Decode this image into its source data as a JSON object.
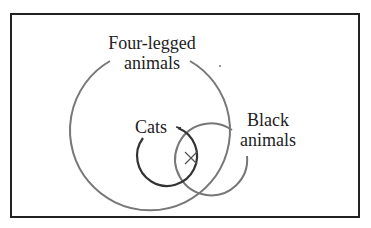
{
  "diagram": {
    "type": "venn",
    "sets": [
      {
        "id": "four-legged",
        "label_line1": "Four-legged",
        "label_line2": "animals",
        "color": "#777777"
      },
      {
        "id": "cats",
        "label": "Cats",
        "color": "#333333"
      },
      {
        "id": "black",
        "label_line1": "Black",
        "label_line2": "animals",
        "color": "#777777"
      }
    ],
    "marker": {
      "symbol": "×",
      "region": "cats ∩ black ∩ four-legged"
    }
  }
}
